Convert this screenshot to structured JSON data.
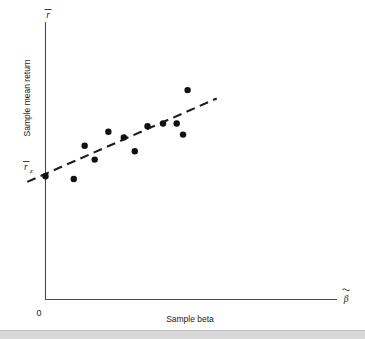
{
  "chart_data": {
    "type": "scatter",
    "title": "",
    "subtitle": "",
    "xlabel": "Sample beta",
    "ylabel": "Sample mean return",
    "x_axis_symbol": "β",
    "x_axis_symbol_accent": "tilde",
    "y_axis_symbol": "r",
    "y_axis_symbol_accent": "overbar",
    "origin_label": "0",
    "intercept_label": "r",
    "intercept_label_subscript": "z",
    "intercept_label_accent": "overbar",
    "grid": false,
    "legend": "none",
    "xlim": [
      0,
      1.6
    ],
    "ylim": [
      0,
      1.0
    ],
    "points": [
      {
        "x": 0.0,
        "y": 0.445
      },
      {
        "x": 0.155,
        "y": 0.435
      },
      {
        "x": 0.215,
        "y": 0.555
      },
      {
        "x": 0.27,
        "y": 0.505
      },
      {
        "x": 0.345,
        "y": 0.605
      },
      {
        "x": 0.43,
        "y": 0.585
      },
      {
        "x": 0.49,
        "y": 0.535
      },
      {
        "x": 0.56,
        "y": 0.625
      },
      {
        "x": 0.645,
        "y": 0.635
      },
      {
        "x": 0.72,
        "y": 0.635
      },
      {
        "x": 0.78,
        "y": 0.755
      },
      {
        "x": 0.755,
        "y": 0.595
      }
    ],
    "fit_line": {
      "style": "dashed",
      "label": "fitted sample security market line",
      "x_start": -0.1,
      "y_start": 0.425,
      "x_end": 0.94,
      "y_end": 0.725,
      "intercept": 0.445,
      "slope": 0.29
    },
    "annotations": [
      {
        "name": "intercept-point",
        "x": 0.0,
        "y": 0.445
      }
    ]
  }
}
